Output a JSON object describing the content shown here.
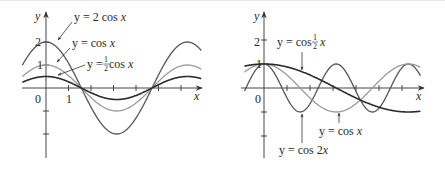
{
  "chart_data": [
    {
      "type": "line",
      "panel": "left",
      "title": "",
      "xlabel": "x",
      "ylabel": "y",
      "x_tick_labels": [
        "0",
        "1"
      ],
      "y_tick_labels": [
        "1",
        "2"
      ],
      "xlim": [
        -1.0,
        7.0
      ],
      "ylim": [
        -2.6,
        2.8
      ],
      "grid": false,
      "series": [
        {
          "name": "y = 2 cos x",
          "expr": "2*cos(x)",
          "amplitude": 2,
          "freq": 1,
          "color": "#555555",
          "width": 1.3
        },
        {
          "name": "y = cos x",
          "expr": "cos(x)",
          "amplitude": 1,
          "freq": 1,
          "color": "#9a9a9a",
          "width": 1.3
        },
        {
          "name": "y = 1/2 cos x",
          "expr": "0.5*cos(x)",
          "amplitude": 0.5,
          "freq": 1,
          "color": "#2b2b2b",
          "width": 1.6
        }
      ],
      "annotations": [
        "y = 2 cos x",
        "y = cos x",
        "y = ½ cos x"
      ]
    },
    {
      "type": "line",
      "panel": "right",
      "title": "",
      "xlabel": "x",
      "ylabel": "y",
      "x_tick_labels": [
        "0"
      ],
      "y_tick_labels": [
        "1",
        "2"
      ],
      "xlim": [
        -0.8,
        6.9
      ],
      "ylim": [
        -2.6,
        2.8
      ],
      "grid": false,
      "series": [
        {
          "name": "y = cos ½x",
          "expr": "cos(x/2)",
          "amplitude": 1,
          "freq": 0.5,
          "color": "#2b2b2b",
          "width": 1.6
        },
        {
          "name": "y = cos x",
          "expr": "cos(x)",
          "amplitude": 1,
          "freq": 1,
          "color": "#9a9a9a",
          "width": 1.3
        },
        {
          "name": "y = cos 2x",
          "expr": "cos(2x)",
          "amplitude": 1,
          "freq": 2,
          "color": "#555555",
          "width": 1.3
        }
      ],
      "annotations": [
        "y = cos ½x",
        "y = cos x",
        "y = cos 2x"
      ]
    }
  ],
  "left": {
    "axis_y": "y",
    "axis_x": "x",
    "origin": "0",
    "tick_x1": "1",
    "tick_y1": "1",
    "tick_y2": "2",
    "label_2cos": {
      "pre": "y = 2 cos ",
      "var": "x"
    },
    "label_cos": {
      "pre": "y = cos ",
      "var": "x"
    },
    "label_half": {
      "pre": "y = ",
      "num": "1",
      "den": "2",
      "post": " cos ",
      "var": "x"
    }
  },
  "right": {
    "axis_y": "y",
    "axis_x": "x",
    "origin": "0",
    "tick_y1": "1",
    "tick_y2": "2",
    "label_cos_half": {
      "pre": "y = cos ",
      "num": "1",
      "den": "2",
      "var": "x"
    },
    "label_cos": {
      "pre": "y = cos ",
      "var": "x"
    },
    "label_cos2": {
      "pre": "y = cos 2",
      "var": "x"
    }
  }
}
